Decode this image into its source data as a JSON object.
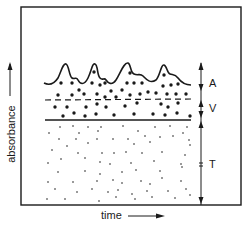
{
  "diagram": {
    "type": "absorbance-time schematic",
    "axes": {
      "x_label": "time",
      "y_label": "absorbance"
    },
    "segments": [
      {
        "key": "A",
        "label": "A",
        "description": "fluctuating top layer with large dots beneath wavy curve"
      },
      {
        "key": "V",
        "label": "V",
        "description": "layer of large dots between dashed line and solid line"
      },
      {
        "key": "T",
        "label": "T",
        "description": "bottom layer filled with small dots"
      }
    ],
    "curve": {
      "peaks": 4
    },
    "colors": {
      "ink": "#1a1a1a",
      "background": "#ffffff"
    }
  }
}
